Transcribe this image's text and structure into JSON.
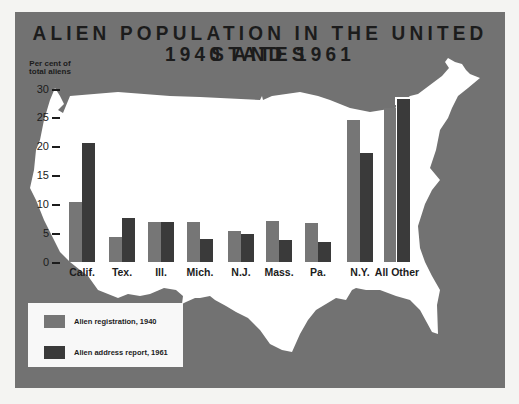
{
  "chart": {
    "title_line1": "ALIEN POPULATION IN THE UNITED STATES",
    "title_line2": "1940 AND 1961",
    "ylabel_line1": "Per cent of",
    "ylabel_line2": "total aliens",
    "yticks": [
      "30",
      "25",
      "20",
      "15",
      "10",
      "5",
      "0"
    ]
  },
  "legend": {
    "item1": "Alien registration, 1940",
    "item2": "Alien address report, 1961"
  },
  "colors": {
    "frame": "#727272",
    "map": "#ffffff",
    "series_1940": "#767676",
    "series_1961": "#3a3a3a",
    "text": "#1c1c1c"
  },
  "chart_data": {
    "type": "bar",
    "xlabel": "",
    "ylabel": "Per cent of total aliens",
    "ylim": [
      0,
      30
    ],
    "yticks": [
      0,
      5,
      10,
      15,
      20,
      25,
      30
    ],
    "grid": false,
    "legend_position": "bottom-left",
    "categories": [
      "Calif.",
      "Tex.",
      "Ill.",
      "Mich.",
      "N.J.",
      "Mass.",
      "Pa.",
      "N.Y.",
      "All Other"
    ],
    "series": [
      {
        "name": "Alien registration, 1940",
        "values": [
          10.4,
          4.4,
          7.0,
          6.9,
          5.3,
          7.1,
          6.8,
          24.6,
          26.7
        ]
      },
      {
        "name": "Alien address report, 1961",
        "values": [
          20.7,
          7.7,
          7.0,
          4.0,
          4.8,
          3.8,
          3.4,
          18.9,
          28.2
        ]
      }
    ]
  }
}
